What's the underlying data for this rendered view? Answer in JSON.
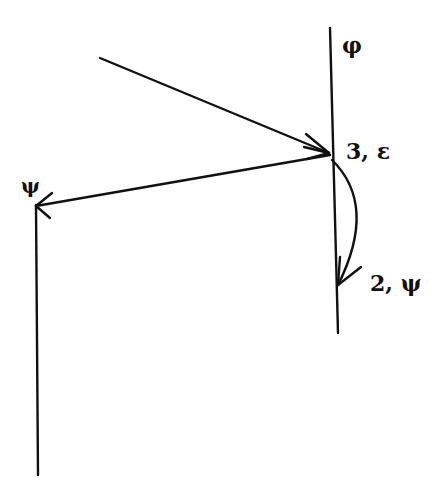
{
  "diagram": {
    "colors": {
      "stroke": "#111111",
      "background": "#ffffff"
    },
    "labels": {
      "phi": "φ",
      "psi_left": "ψ",
      "node_3": "3, ε",
      "node_2": "2, ψ"
    },
    "lines": [
      {
        "name": "right-vertical-line",
        "x1": 330,
        "y1": 28,
        "x2": 338,
        "y2": 333
      },
      {
        "name": "left-vertical-line",
        "x1": 35,
        "y1": 205,
        "x2": 38,
        "y2": 475
      }
    ],
    "arrows": [
      {
        "name": "incoming-arrow",
        "from": [
          100,
          58
        ],
        "to": [
          330,
          153
        ]
      },
      {
        "name": "left-arrow",
        "from": [
          330,
          155
        ],
        "to": [
          35,
          206
        ]
      },
      {
        "name": "curved-arrow",
        "from": [
          332,
          160
        ],
        "to": [
          338,
          285
        ]
      }
    ]
  }
}
